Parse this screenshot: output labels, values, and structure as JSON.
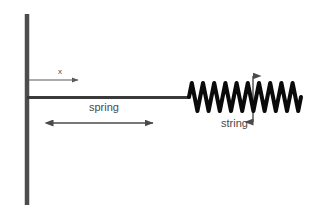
{
  "figure": {
    "kind": "physics-diagram",
    "background_color": "#ffffff"
  },
  "labels": {
    "x_axis": "x",
    "spring": "spring",
    "string": "string"
  },
  "elements": {
    "wall": {
      "name": "wall",
      "color": "#4d4d4d",
      "x": 25,
      "y_top": 14,
      "y_bottom": 205,
      "thickness": 4
    },
    "x_axis_arrow": {
      "name": "x-axis-arrow",
      "color": "#5a5a5a",
      "direction": "right",
      "x_start": 29,
      "x_end": 83,
      "y": 80
    },
    "spring_line": {
      "name": "spring-line",
      "color": "#3a3a3a",
      "x_start": 28,
      "x_end": 189,
      "y": 97,
      "thickness": 3
    },
    "oscillation_arrow": {
      "name": "oscillation-double-arrow",
      "color": "#4a4a4a",
      "direction": "both-horizontal",
      "x_start": 45,
      "x_end": 161,
      "y": 123
    },
    "string_wave": {
      "name": "string-wave",
      "color": "#0a0a0a",
      "x_start": 189,
      "x_end": 301,
      "center_y": 97,
      "amplitude": 14,
      "cycles": 10,
      "stroke_width": 4
    },
    "amplitude_arrow": {
      "name": "amplitude-double-arrow",
      "color": "#4a4a4a",
      "direction": "both-vertical",
      "x": 253,
      "y_top": 67,
      "y_bottom": 131
    }
  },
  "colors": {
    "wall_gray": "#4d4d4d",
    "line_gray": "#3a3a3a",
    "arrow_gray": "#4a4a4a",
    "wave_black": "#0a0a0a",
    "text_gray": "#4a4a4a",
    "background": "#ffffff"
  }
}
